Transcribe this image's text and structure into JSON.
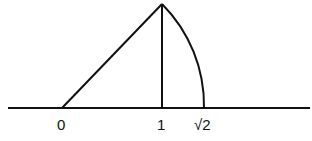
{
  "diagram": {
    "colors": {
      "stroke": "#111111",
      "background": "#ffffff"
    },
    "number_line": {
      "x_start": 8,
      "x_end": 310,
      "y": 108
    },
    "points": {
      "origin": {
        "x": 62,
        "y": 108
      },
      "one": {
        "x": 162,
        "y": 108
      },
      "apex": {
        "x": 162,
        "y": 4
      },
      "sqrt2": {
        "x": 204,
        "y": 108
      }
    },
    "labels": {
      "zero": "0",
      "one": "1",
      "sqrt2": "√2"
    }
  }
}
